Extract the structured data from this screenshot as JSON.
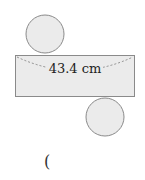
{
  "diagram": {
    "type": "cylinder-net",
    "rectangle": {
      "label": "43.4 cm"
    },
    "answer_blank": {
      "text": "("
    },
    "colors": {
      "fill": "#ebebeb",
      "stroke": "#8a8a8a",
      "dash": "#777777",
      "text": "#222222"
    }
  }
}
